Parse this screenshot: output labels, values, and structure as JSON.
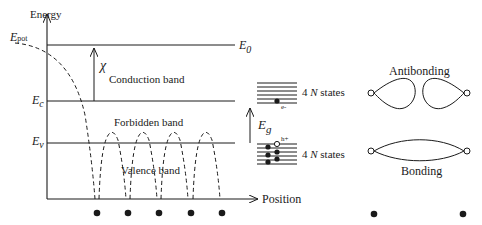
{
  "axes": {
    "y_label": "Energy",
    "x_label": "Position"
  },
  "levels": {
    "E_pot": {
      "symbol": "E",
      "sub": "pot"
    },
    "E_0": {
      "symbol": "E",
      "sub": "0"
    },
    "E_c": {
      "symbol": "E",
      "sub": "c"
    },
    "E_v": {
      "symbol": "E",
      "sub": "v"
    }
  },
  "bands": {
    "conduction": "Conduction band",
    "forbidden": "Forbidden band",
    "valence": "Valence band"
  },
  "electron_affinity": "χ",
  "band_gap": {
    "symbol": "E",
    "sub": "g"
  },
  "states": {
    "upper": "4 N states",
    "lower": "4 N states",
    "upper_count": "4",
    "lower_count": "4",
    "N": "N",
    "word": "states"
  },
  "carriers": {
    "electron": "e-",
    "hole": "h+"
  },
  "orbitals": {
    "antibonding": "Antibonding",
    "bonding": "Bonding"
  },
  "colors": {
    "line": "#1a1a1a",
    "background": "#ffffff"
  }
}
